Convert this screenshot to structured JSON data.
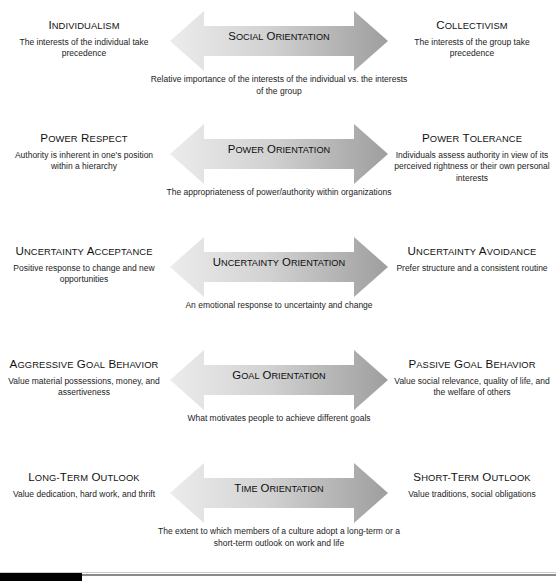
{
  "figure": {
    "arrow_gradient_start": "#ececec",
    "arrow_gradient_end": "#9e9e9e",
    "text_color": "#1a1a1a",
    "footer_bar_color": "#000000",
    "footer_rule_color": "#8a8a8a"
  },
  "rows": [
    {
      "left_title_cap": "I",
      "left_title_rest": "NDIVIDUALISM",
      "left_desc": "The interests of the individual take precedence",
      "center_label_parts": [
        {
          "cap": "S",
          "rest": "OCIAL"
        },
        {
          "cap": "O",
          "rest": "RIENTATION"
        }
      ],
      "center_desc": "Relative importance of the interests of the individual vs. the interests of the group",
      "right_title_cap": "C",
      "right_title_rest": "OLLECTIVISM",
      "right_desc": "The interests of the group take precedence"
    },
    {
      "left_title_cap": "P",
      "left_title_rest": "OWER",
      "left_title_cap2": "R",
      "left_title_rest2": "ESPECT",
      "left_desc": "Authority is inherent in one's position within a hierarchy",
      "center_label_parts": [
        {
          "cap": "P",
          "rest": "OWER"
        },
        {
          "cap": "O",
          "rest": "RIENTATION"
        }
      ],
      "center_desc": "The appropriateness of power/authority within organizations",
      "right_title_cap": "P",
      "right_title_rest": "OWER",
      "right_title_cap2": "T",
      "right_title_rest2": "OLERANCE",
      "right_desc": "Individuals assess authority in view of its perceived rightness or their own personal interests"
    },
    {
      "left_title_cap": "U",
      "left_title_rest": "NCERTAINTY",
      "left_title_cap2": "A",
      "left_title_rest2": "CCEPTANCE",
      "left_desc": "Positive response to change and new opportunities",
      "center_label_parts": [
        {
          "cap": "U",
          "rest": "NCERTAINTY"
        },
        {
          "cap": "O",
          "rest": "RIENTATION"
        }
      ],
      "center_desc": "An emotional response to uncertainty and change",
      "right_title_cap": "U",
      "right_title_rest": "NCERTAINTY",
      "right_title_cap2": "A",
      "right_title_rest2": "VOIDANCE",
      "right_desc": "Prefer structure and a consistent routine"
    },
    {
      "left_title_cap": "A",
      "left_title_rest": "GGRESSIVE",
      "left_title_cap2": "G",
      "left_title_rest2": "OAL",
      "left_title_cap3": "B",
      "left_title_rest3": "EHAVIOR",
      "left_desc": "Value material possessions, money, and assertiveness",
      "center_label_parts": [
        {
          "cap": "G",
          "rest": "OAL"
        },
        {
          "cap": "O",
          "rest": "RIENTATION"
        }
      ],
      "center_desc": "What motivates people to achieve different goals",
      "right_title_cap": "P",
      "right_title_rest": "ASSIVE",
      "right_title_cap2": "G",
      "right_title_rest2": "OAL",
      "right_title_cap3": "B",
      "right_title_rest3": "EHAVIOR",
      "right_desc": "Value social relevance, quality of life, and the welfare of others"
    },
    {
      "left_title_cap": "L",
      "left_title_rest": "ONG-",
      "left_title_cap2": "T",
      "left_title_rest2": "ERM",
      "left_title_cap3": "O",
      "left_title_rest3": "UTLOOK",
      "left_desc": "Value dedication, hard work, and thrift",
      "center_label_parts": [
        {
          "cap": "T",
          "rest": "IME"
        },
        {
          "cap": "O",
          "rest": "RIENTATION"
        }
      ],
      "center_desc": "The extent to which members of a culture adopt a long-term or a short-term outlook on work and life",
      "right_title_cap": "S",
      "right_title_rest": "HORT-",
      "right_title_cap2": "T",
      "right_title_rest2": "ERM",
      "right_title_cap3": "O",
      "right_title_rest3": "UTLOOK",
      "right_desc": "Value traditions, social obligations"
    }
  ]
}
